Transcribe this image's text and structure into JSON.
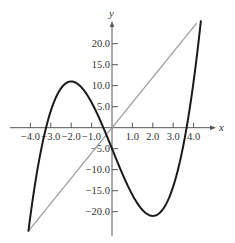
{
  "chart_data": {
    "type": "line",
    "title": "",
    "xlabel": "x",
    "ylabel": "y",
    "xlim": [
      -4.1,
      4.4
    ],
    "ylim": [
      -25,
      25
    ],
    "grid": false,
    "legend": null,
    "x_ticks": [
      -4.0,
      -3.0,
      -2.0,
      -1.0,
      1.0,
      2.0,
      3.0,
      4.0
    ],
    "x_tick_labels": [
      "−4.0",
      "−3.0",
      "−2.0",
      "−1.0",
      "1.0",
      "2.0",
      "3.0",
      "4.0"
    ],
    "y_ticks": [
      20.0,
      15.0,
      10.0,
      5.0,
      -5.0,
      -10.0,
      -15.0,
      -20.0
    ],
    "y_tick_labels": [
      "20.0",
      "15.0",
      "10.0",
      "5.0",
      "−5.0",
      "−10.0",
      "−15.0",
      "−20.0"
    ],
    "series": [
      {
        "name": "cubic curve",
        "expression": "y = x^3 - 12x - 5",
        "color": "#1a1a1a",
        "x_range": [
          -4.1,
          4.36
        ],
        "points": [
          [
            -4.1,
            -24.7
          ],
          [
            -4.0,
            -21.0
          ],
          [
            -3.0,
            4.0
          ],
          [
            -2.0,
            11.0
          ],
          [
            -1.0,
            6.0
          ],
          [
            0.0,
            -5.0
          ],
          [
            1.0,
            -16.0
          ],
          [
            2.0,
            -21.0
          ],
          [
            3.0,
            -14.0
          ],
          [
            4.0,
            11.0
          ],
          [
            4.36,
            25.6
          ]
        ]
      },
      {
        "name": "straight line",
        "expression": "y = 6x",
        "color": "#999999",
        "x_range": [
          -4.1,
          4.15
        ],
        "points": [
          [
            -4.1,
            -24.6
          ],
          [
            0.0,
            0.0
          ],
          [
            4.15,
            24.9
          ]
        ]
      }
    ]
  },
  "axes": {
    "x_label": "x",
    "y_label": "y"
  }
}
